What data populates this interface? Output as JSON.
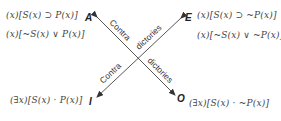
{
  "diagram": {
    "type": "square-of-opposition",
    "corners": {
      "A": {
        "label": "A",
        "formulas": [
          "(x)[S(x) ⊃ P(x)]",
          "(x)[~S(x) ∨ P(x)]"
        ]
      },
      "E": {
        "label": "E",
        "formulas": [
          "(x)[S(x) ⊃ ~P(x)]",
          "(x)[~S(x) ∨ ~P(x)]"
        ]
      },
      "I": {
        "label": "I",
        "formulas": [
          "(∃x)[S(x) · P(x)]"
        ]
      },
      "O": {
        "label": "O",
        "formulas": [
          "(∃x)[S(x) · ~P(x)]"
        ]
      }
    },
    "relations": [
      {
        "from": "A",
        "to": "O",
        "label_part1": "Contra",
        "label_part2": "dictories"
      },
      {
        "from": "E",
        "to": "I",
        "label_part1": "Contra",
        "label_part2": "dictories"
      }
    ]
  }
}
